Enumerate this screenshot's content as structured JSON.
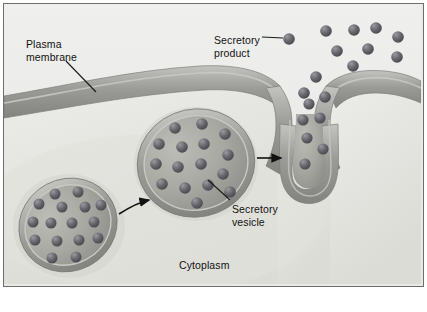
{
  "figure": {
    "domain": "biology-diagram",
    "width": 427,
    "height": 312
  },
  "labels": {
    "plasma_membrane_line1": "Plasma",
    "plasma_membrane_line2": "membrane",
    "secretory_product_line1": "Secretory",
    "secretory_product_line2": "product",
    "secretory_vesicle_line1": "Secretory",
    "secretory_vesicle_line2": "vesicle",
    "cytoplasm": "Cytoplasm"
  },
  "colors": {
    "background_cytoplasm": "#e4e4e0",
    "extracellular": "#ececeb",
    "membrane_dark": "#8d8d8b",
    "membrane_light": "#b9b9b6",
    "vesicle_fill": "#a9a9a4",
    "vesicle_rim": "#7f7f7c",
    "granule_dark": "#56565a",
    "granule_light": "#8d8d92",
    "label_text": "#121212",
    "plate_border": "#6e6e6e",
    "leader_line": "#1a1a1a",
    "arrow": "#111111"
  },
  "structures": {
    "plasma_membrane": {
      "name": "plasma membrane",
      "description": "undulating bilayer band spanning the figure with a fusion pore at upper right"
    },
    "vesicle_left": {
      "name": "secretory vesicle (distant)",
      "granule_count": 16,
      "state": "free in cytoplasm"
    },
    "vesicle_middle": {
      "name": "secretory vesicle (approaching)",
      "granule_count": 16,
      "state": "migrating toward membrane"
    },
    "vesicle_fusing": {
      "name": "secretory vesicle (fusing)",
      "granule_count": 6,
      "state": "fused with plasma membrane, releasing contents"
    },
    "secretory_product": {
      "name": "secretory product granules",
      "granule_count": 12,
      "location": "extracellular space"
    }
  },
  "arrows": [
    {
      "name": "arrow-left-to-middle",
      "type": "curved",
      "direction": "up-right"
    },
    {
      "name": "arrow-middle-to-fusing",
      "type": "straight",
      "direction": "right"
    }
  ],
  "leader_lines": [
    {
      "name": "leader-plasma-membrane",
      "from_label": "Plasma membrane"
    },
    {
      "name": "leader-secretory-product",
      "from_label": "Secretory product"
    },
    {
      "name": "leader-secretory-vesicle",
      "from_label": "Secretory vesicle"
    }
  ]
}
